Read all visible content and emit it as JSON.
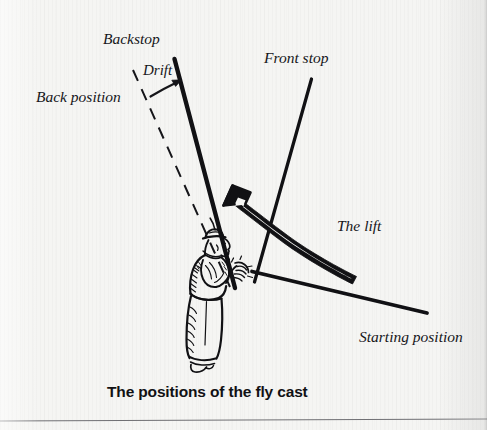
{
  "figure": {
    "caption": "The positions of the fly cast",
    "caption_position": {
      "x": 107,
      "y": 383
    },
    "background_color": "#f5f5f3",
    "ink_color": "#111114",
    "labels": [
      {
        "name": "backstop",
        "text": "Backstop",
        "x": 103,
        "y": 31,
        "size": "lg"
      },
      {
        "name": "drift",
        "text": "Drift",
        "x": 143,
        "y": 63,
        "size": "md"
      },
      {
        "name": "back-position",
        "text": "Back position",
        "x": 36,
        "y": 89,
        "size": "lg"
      },
      {
        "name": "front-stop",
        "text": "Front stop",
        "x": 264,
        "y": 50,
        "size": "lg"
      },
      {
        "name": "the-lift",
        "text": "The lift",
        "x": 337,
        "y": 218,
        "size": "lg"
      },
      {
        "name": "starting-position",
        "text": "Starting position",
        "x": 359,
        "y": 329,
        "size": "lg"
      }
    ],
    "lines": [
      {
        "name": "backstop-rod-line",
        "style": "solid",
        "x1": 174,
        "y1": 60,
        "x2": 234,
        "y2": 285,
        "width": 4.2
      },
      {
        "name": "back-position-line",
        "style": "dashed",
        "x1": 133,
        "y1": 70,
        "x2": 229,
        "y2": 285,
        "width": 2.0
      },
      {
        "name": "front-stop-rod-line",
        "style": "solid",
        "x1": 311,
        "y1": 80,
        "x2": 255,
        "y2": 281,
        "width": 3.2
      },
      {
        "name": "starting-position-line",
        "style": "solid",
        "x1": 253,
        "y1": 272,
        "x2": 427,
        "y2": 313,
        "width": 3.6
      }
    ],
    "arrows": [
      {
        "name": "drift-arrow",
        "description": "small curved arrow from back position to backstop",
        "style": "thin-curved"
      },
      {
        "name": "lift-arrow",
        "description": "large hollow outlined curved arrow sweeping up-left",
        "style": "hollow-curved"
      }
    ],
    "angler": {
      "name": "angler-figure",
      "description": "pen-and-ink drawing of a fly fisherman holding a rod, wearing a cap, facing right"
    }
  }
}
